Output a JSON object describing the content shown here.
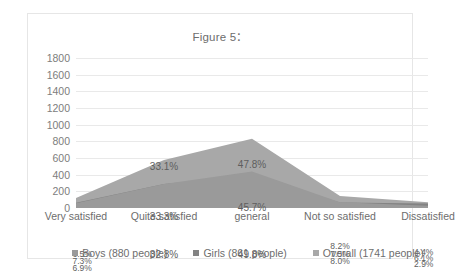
{
  "chart_data": {
    "type": "area",
    "title": "Figure 5：",
    "xlabel": "",
    "ylabel": "",
    "ylim": [
      0,
      1800
    ],
    "grid": true,
    "legend_position": "bottom",
    "categories": [
      "Very satisfied",
      "Quite satisfied",
      "general",
      "Not so satisfied",
      "Dissatisfied"
    ],
    "yticks": [
      "0",
      "200",
      "400",
      "600",
      "800",
      "1000",
      "1200",
      "1400",
      "1600",
      "1800"
    ],
    "series": [
      {
        "name": "Boys (880 people)",
        "color": "#9a9a9a",
        "values": [
          57,
          289,
          438,
          70,
          26
        ],
        "labels": [
          "6.5%",
          "32.8%",
          "49.8%",
          "8.0%",
          "2.9%"
        ]
      },
      {
        "name": "Girls (861 people)",
        "color": "#838383",
        "values": [
          63,
          287,
          393,
          65,
          53
        ],
        "labels": [
          "7.3%",
          "33.3%",
          "45.7%",
          "7.5%",
          "6.1%"
        ]
      },
      {
        "name": "Overall (1741 people)",
        "color": "#a8a8a8",
        "values": [
          120,
          576,
          832,
          143,
          70
        ],
        "labels": [
          "6.9%",
          "33.1%",
          "47.8%",
          "8.2%",
          "4.4%"
        ]
      }
    ],
    "stacked": true,
    "annotations": [
      {
        "text": "6.5%",
        "x": 0,
        "y": 196,
        "size": "small"
      },
      {
        "text": "7.3%",
        "x": 0,
        "y": 203,
        "size": "small"
      },
      {
        "text": "6.9%",
        "x": 0,
        "y": 210,
        "size": "small"
      },
      {
        "text": "32.8%",
        "x": 1,
        "y": 196,
        "size": "normal"
      },
      {
        "text": "33.3%",
        "x": 1,
        "y": 158,
        "size": "normal"
      },
      {
        "text": "33.1%",
        "x": 1,
        "y": 108,
        "size": "normal"
      },
      {
        "text": "49.8%",
        "x": 2,
        "y": 196,
        "size": "normal"
      },
      {
        "text": "45.7%",
        "x": 2,
        "y": 149,
        "size": "normal"
      },
      {
        "text": "47.8%",
        "x": 2,
        "y": 106,
        "size": "normal"
      },
      {
        "text": "8.2%",
        "x": 3,
        "y": 188,
        "size": "small"
      },
      {
        "text": "7.5%",
        "x": 3,
        "y": 196,
        "size": "small"
      },
      {
        "text": "8.0%",
        "x": 3,
        "y": 203,
        "size": "small"
      },
      {
        "text": "4.4%",
        "x": 4,
        "y": 194,
        "size": "small"
      },
      {
        "text": "6.1%",
        "x": 4,
        "y": 200,
        "size": "small"
      },
      {
        "text": "2.9%",
        "x": 4,
        "y": 206,
        "size": "small"
      }
    ]
  }
}
